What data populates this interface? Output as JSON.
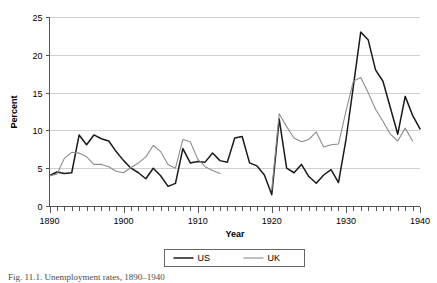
{
  "figure": {
    "caption": "Fig. 11.1. Unemployment rates, 1890–1940"
  },
  "chart_data": {
    "type": "line",
    "title": "",
    "xlabel": "Year",
    "ylabel": "Percent",
    "xlim": [
      1890,
      1940
    ],
    "ylim": [
      0,
      25
    ],
    "ytick_labels": [
      "0",
      "5",
      "10",
      "15",
      "20",
      "25"
    ],
    "yticks": [
      0,
      5,
      10,
      15,
      20,
      25
    ],
    "xtick_labels": [
      "1890",
      "1900",
      "1910",
      "1920",
      "1930",
      "1940"
    ],
    "xticks": [
      1890,
      1900,
      1910,
      1920,
      1930,
      1940
    ],
    "xtick_minor_step": 1,
    "grid": "horizontal",
    "legend_position": "bottom-center",
    "colors": {
      "us": "#1a1a1a",
      "uk": "#8c8c8c",
      "gridline": "#d0d0d0",
      "axis": "#555555",
      "background": "#ffffff"
    },
    "series": [
      {
        "name": "US",
        "color": "#1a1a1a",
        "linewidth": 1.5,
        "x": [
          1890,
          1891,
          1892,
          1893,
          1894,
          1895,
          1896,
          1897,
          1898,
          1899,
          1900,
          1901,
          1902,
          1903,
          1904,
          1905,
          1906,
          1907,
          1908,
          1909,
          1910,
          1911,
          1912,
          1913,
          1914,
          1915,
          1916,
          1917,
          1918,
          1919,
          1920,
          1921,
          1922,
          1923,
          1924,
          1925,
          1926,
          1927,
          1928,
          1929,
          1930,
          1931,
          1932,
          1933,
          1934,
          1935,
          1936,
          1937,
          1938,
          1939,
          1940
        ],
        "values": [
          4.0,
          4.5,
          4.3,
          4.4,
          9.4,
          8.1,
          9.4,
          8.9,
          8.6,
          7.2,
          6.0,
          5.0,
          4.4,
          3.6,
          5.0,
          4.0,
          2.6,
          3.0,
          7.6,
          5.7,
          5.9,
          5.8,
          7.0,
          6.0,
          5.8,
          9.0,
          9.2,
          5.7,
          5.3,
          4.1,
          1.5,
          11.5,
          5.0,
          4.4,
          5.5,
          3.9,
          3.0,
          4.1,
          4.8,
          3.1,
          8.7,
          15.8,
          23.0,
          22.0,
          18.0,
          16.5,
          13.0,
          9.5,
          14.5,
          12.0,
          10.2
        ]
      },
      {
        "name": "UK",
        "color": "#8c8c8c",
        "linewidth": 1.1,
        "segments": [
          {
            "x": [
              1890,
              1891,
              1892,
              1893,
              1894,
              1895,
              1896,
              1897,
              1898,
              1899,
              1900,
              1901,
              1902,
              1903,
              1904,
              1905,
              1906,
              1907,
              1908,
              1909,
              1910,
              1911,
              1912,
              1913
            ],
            "values": [
              4.0,
              4.2,
              6.3,
              7.1,
              7.0,
              6.5,
              5.5,
              5.5,
              5.2,
              4.6,
              4.4,
              5.1,
              5.7,
              6.5,
              8.0,
              7.2,
              5.5,
              5.0,
              8.8,
              8.5,
              6.2,
              5.2,
              4.7,
              4.3
            ]
          },
          {
            "x": [
              1920,
              1921,
              1922,
              1923,
              1924,
              1925,
              1926,
              1927,
              1928,
              1929,
              1930,
              1931,
              1932,
              1933,
              1934,
              1935,
              1936,
              1937,
              1938,
              1939
            ],
            "values": [
              2.2,
              12.2,
              10.5,
              9.0,
              8.5,
              8.8,
              9.8,
              7.8,
              8.1,
              8.2,
              12.5,
              16.5,
              17.0,
              15.0,
              12.8,
              11.2,
              9.5,
              8.6,
              10.3,
              8.6
            ]
          }
        ]
      }
    ],
    "legend": [
      {
        "label": "US",
        "color": "#1a1a1a",
        "linewidth": 1.5
      },
      {
        "label": "UK",
        "color": "#8c8c8c",
        "linewidth": 1.1
      }
    ]
  }
}
